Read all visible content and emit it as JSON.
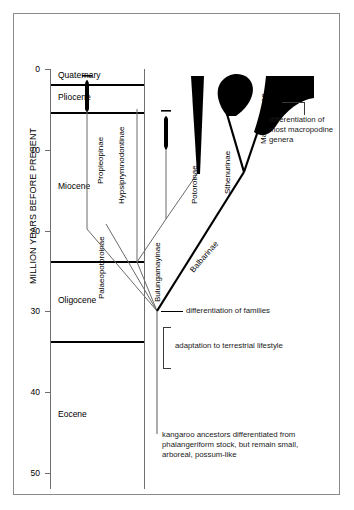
{
  "axis": {
    "title": "MILLION YEARS BEFORE PRESENT",
    "ticks": [
      {
        "value": "0",
        "my": 0
      },
      {
        "value": "10",
        "my": 10
      },
      {
        "value": "20",
        "my": 20
      },
      {
        "value": "30",
        "my": 30
      },
      {
        "value": "40",
        "my": 40
      },
      {
        "value": "50",
        "my": 50
      }
    ],
    "range": [
      0,
      52
    ]
  },
  "epochs": [
    {
      "name": "Quaternary",
      "top_my": 0,
      "bottom_my": 1.8
    },
    {
      "name": "Pliocene",
      "top_my": 1.8,
      "bottom_my": 5.3
    },
    {
      "name": "Miocene",
      "top_my": 5.3,
      "bottom_my": 23.8
    },
    {
      "name": "Oligocene",
      "top_my": 23.8,
      "bottom_my": 33.7
    },
    {
      "name": "Eocene",
      "top_my": 33.7,
      "bottom_my": 52
    }
  ],
  "taxa": [
    {
      "name": "Propleopinae",
      "orientation": "vertical"
    },
    {
      "name": "Hypsiprymnodontinae",
      "orientation": "vertical"
    },
    {
      "name": "Palaeopotoroinae",
      "orientation": "vertical"
    },
    {
      "name": "Bulungamayinae",
      "orientation": "vertical"
    },
    {
      "name": "Potoroinae",
      "orientation": "vertical"
    },
    {
      "name": "Balbarinae",
      "orientation": "diagonal"
    },
    {
      "name": "Sthenurinae",
      "orientation": "vertical"
    },
    {
      "name": "Macropodinae",
      "orientation": "vertical"
    }
  ],
  "annotations": [
    {
      "id": "macropodine-genera",
      "text": "differentiation of most macropodine genera"
    },
    {
      "id": "families",
      "text": "differentiation of families"
    },
    {
      "id": "terrestrial",
      "text": "adaptation to terrestrial lifestyle"
    },
    {
      "id": "ancestors",
      "text": "kangaroo ancestors differentiated from phalangeriform stock, but remain small, arboreal, possum-like"
    }
  ],
  "colors": {
    "ink": "#000000",
    "rule": "#6f6f6f",
    "frame": "#8a8a8a",
    "paper": "#ffffff"
  }
}
